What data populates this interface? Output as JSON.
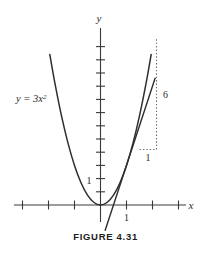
{
  "figure": {
    "caption": "FIGURE 4.31",
    "equation_label": "y = 3x",
    "equation_exponent": "2",
    "x_axis_name": "x",
    "y_axis_name": "y",
    "x_tick_label": "1",
    "y_tick_label": "1",
    "run_label": "1",
    "rise_label": "6",
    "colors": {
      "curve": "#2e2e2e",
      "axis": "#3a3a3a",
      "guide": "#6b6b6b",
      "background": "#ffffff",
      "caption": "#1c1c1c"
    }
  },
  "chart_data": {
    "type": "line",
    "title": "FIGURE 4.31",
    "xlabel": "x",
    "ylabel": "y",
    "grid": false,
    "legend": null,
    "xlim": [
      -3.3,
      3.3
    ],
    "ylim": [
      -1.4,
      13.0
    ],
    "x_ticks": [
      -3,
      -2,
      -1,
      1,
      2,
      3
    ],
    "y_ticks": [
      1,
      2,
      3,
      4,
      5,
      6,
      7,
      8,
      9,
      10,
      11,
      12
    ],
    "x_tick_labels": [
      {
        "value": 1,
        "text": "1"
      }
    ],
    "y_tick_labels": [
      {
        "value": 1,
        "text": "1"
      }
    ],
    "origin_px": {
      "x": 100.5,
      "y": 205.0
    },
    "px_per_unit": {
      "x": 26.0,
      "y": 13.2
    },
    "series": [
      {
        "name": "y = 3x^2",
        "type": "parabola",
        "coefficient": 3,
        "label": "y = 3x²",
        "x_range": [
          -1.95,
          1.95
        ],
        "points": [
          {
            "x": -1.95,
            "y": 11.41
          },
          {
            "x": -1.75,
            "y": 9.19
          },
          {
            "x": -1.5,
            "y": 6.75
          },
          {
            "x": -1.25,
            "y": 4.69
          },
          {
            "x": -1.0,
            "y": 3.0
          },
          {
            "x": -0.75,
            "y": 1.69
          },
          {
            "x": -0.5,
            "y": 0.75
          },
          {
            "x": -0.25,
            "y": 0.19
          },
          {
            "x": 0.0,
            "y": 0.0
          },
          {
            "x": 0.25,
            "y": 0.19
          },
          {
            "x": 0.5,
            "y": 0.75
          },
          {
            "x": 0.75,
            "y": 1.69
          },
          {
            "x": 1.0,
            "y": 3.0
          },
          {
            "x": 1.25,
            "y": 4.69
          },
          {
            "x": 1.5,
            "y": 6.75
          },
          {
            "x": 1.75,
            "y": 9.19
          },
          {
            "x": 1.95,
            "y": 11.41
          }
        ]
      },
      {
        "name": "tangent at x = 1",
        "type": "line",
        "slope": 6,
        "intercept": -3,
        "tangent_point": {
          "x": 1,
          "y": 3
        },
        "x_range": [
          0.18,
          2.1
        ],
        "points": [
          {
            "x": 0.18,
            "y": -1.92
          },
          {
            "x": 2.1,
            "y": 9.6
          }
        ]
      }
    ],
    "annotations": [
      {
        "name": "slope-triangle",
        "type": "dotted-right-triangle",
        "corner": {
          "x": 1.5,
          "y": 6.0
        },
        "run": {
          "from": {
            "x": 1.5,
            "y": 4.2
          },
          "to": {
            "x": 2.15,
            "y": 4.2
          },
          "label": "1"
        },
        "rise": {
          "from": {
            "x": 2.15,
            "y": 4.2
          },
          "to": {
            "x": 2.15,
            "y": 12.6
          },
          "label": "6"
        }
      }
    ]
  }
}
